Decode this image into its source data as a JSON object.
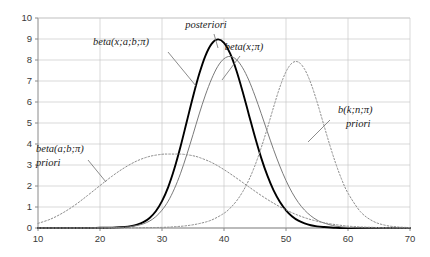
{
  "chart_data": {
    "type": "line",
    "title": "",
    "xlabel": "",
    "ylabel": "",
    "xlim": [
      10,
      70
    ],
    "ylim": [
      0,
      10
    ],
    "xticks": [
      10,
      20,
      30,
      40,
      50,
      60,
      70
    ],
    "yticks": [
      0,
      1,
      2,
      3,
      4,
      5,
      6,
      7,
      8,
      9,
      10
    ],
    "grid": true,
    "legend_position": "inline-annotations",
    "series": [
      {
        "name": "posteriori",
        "label": "posteriori",
        "style": "solid-bold",
        "color": "#000000",
        "width": 1.9,
        "peak_x": 39,
        "peak_y": 9.0,
        "x": [
          10,
          12,
          14,
          16,
          18,
          20,
          22,
          24,
          25,
          26,
          27,
          28,
          29,
          30,
          31,
          32,
          33,
          34,
          35,
          36,
          37,
          38,
          39,
          40,
          41,
          42,
          43,
          44,
          45,
          46,
          47,
          48,
          49,
          50,
          51,
          52,
          53,
          54,
          55,
          56,
          58,
          60,
          62,
          64,
          66,
          68,
          70
        ],
        "y": [
          0.0,
          0.0,
          0.0,
          0.0,
          0.0,
          0.01,
          0.02,
          0.05,
          0.09,
          0.16,
          0.28,
          0.48,
          0.8,
          1.28,
          1.95,
          2.83,
          3.89,
          5.07,
          6.25,
          7.33,
          8.2,
          8.77,
          8.98,
          8.82,
          8.3,
          7.5,
          6.5,
          5.41,
          4.33,
          3.34,
          2.49,
          1.79,
          1.25,
          0.84,
          0.55,
          0.35,
          0.22,
          0.13,
          0.08,
          0.05,
          0.01,
          0.0,
          0.0,
          0.0,
          0.0,
          0.0,
          0.0
        ]
      },
      {
        "name": "beta-x-a-b-pi",
        "label": "beta(x;a;b;π)",
        "style": "solid-thin",
        "color": "#7a7a7a",
        "width": 1.0,
        "peak_x": 41,
        "peak_y": 8.2,
        "x": [
          10,
          12,
          14,
          16,
          18,
          20,
          22,
          24,
          25,
          26,
          27,
          28,
          29,
          30,
          31,
          32,
          33,
          34,
          35,
          36,
          37,
          38,
          39,
          40,
          41,
          42,
          43,
          44,
          45,
          46,
          47,
          48,
          49,
          50,
          51,
          52,
          53,
          54,
          55,
          56,
          58,
          60,
          62,
          64,
          66,
          68,
          70
        ],
        "y": [
          0.0,
          0.0,
          0.0,
          0.0,
          0.0,
          0.01,
          0.02,
          0.04,
          0.07,
          0.12,
          0.2,
          0.33,
          0.54,
          0.85,
          1.28,
          1.87,
          2.61,
          3.49,
          4.45,
          5.43,
          6.33,
          7.1,
          7.7,
          8.06,
          8.17,
          8.02,
          7.63,
          7.04,
          6.29,
          5.45,
          4.58,
          3.73,
          2.95,
          2.26,
          1.68,
          1.21,
          0.85,
          0.58,
          0.38,
          0.25,
          0.09,
          0.03,
          0.01,
          0.0,
          0.0,
          0.0,
          0.0
        ]
      },
      {
        "name": "beta-a-b-pi-priori",
        "label": "beta(a;b;π)",
        "sublabel": "priori",
        "style": "dashed",
        "color": "#8c8c8c",
        "width": 1.0,
        "peak_x": 33,
        "peak_y": 3.52,
        "x": [
          10,
          12,
          14,
          16,
          18,
          20,
          22,
          24,
          26,
          28,
          30,
          31,
          32,
          33,
          34,
          35,
          36,
          38,
          40,
          42,
          44,
          46,
          48,
          50,
          52,
          54,
          56,
          58,
          60,
          62,
          64,
          66,
          68,
          70
        ],
        "y": [
          0.22,
          0.42,
          0.72,
          1.1,
          1.55,
          2.02,
          2.48,
          2.88,
          3.2,
          3.41,
          3.51,
          3.52,
          3.52,
          3.52,
          3.49,
          3.44,
          3.36,
          3.12,
          2.78,
          2.38,
          1.96,
          1.55,
          1.18,
          0.86,
          0.6,
          0.4,
          0.26,
          0.16,
          0.09,
          0.05,
          0.03,
          0.01,
          0.01,
          0.0
        ]
      },
      {
        "name": "b-k-n-pi-priori",
        "label": "b(k;n;π)",
        "sublabel": "priori",
        "style": "dashed",
        "color": "#8c8c8c",
        "width": 1.0,
        "peak_x": 50,
        "peak_y": 7.9,
        "x": [
          10,
          14,
          18,
          22,
          26,
          30,
          32,
          34,
          36,
          38,
          40,
          41,
          42,
          43,
          44,
          45,
          46,
          47,
          48,
          49,
          50,
          51,
          52,
          53,
          54,
          55,
          56,
          57,
          58,
          59,
          60,
          62,
          64,
          66,
          68,
          70
        ],
        "y": [
          0.0,
          0.0,
          0.0,
          0.0,
          0.01,
          0.03,
          0.06,
          0.11,
          0.21,
          0.38,
          0.7,
          0.95,
          1.28,
          1.72,
          2.28,
          2.98,
          3.82,
          4.76,
          5.76,
          6.7,
          7.44,
          7.86,
          7.9,
          7.56,
          6.9,
          6.01,
          5.01,
          4.01,
          3.09,
          2.3,
          1.66,
          0.78,
          0.33,
          0.13,
          0.05,
          0.02
        ]
      }
    ],
    "annotations": [
      {
        "id": "posteriori-label",
        "text": "posteriori",
        "x_px": 206,
        "y_px": 28
      },
      {
        "id": "beta-x-a-b-pi-label",
        "text": "beta(x;a;b;π)",
        "x_px": 121,
        "y_px": 45
      },
      {
        "id": "beta-x-pi-label",
        "text": "beta(x;π)",
        "x_px": 244,
        "y_px": 50
      },
      {
        "id": "b-k-n-pi-label",
        "text": "b(k;n;π)",
        "x_px": 338,
        "y_px": 113
      },
      {
        "id": "b-k-n-pi-priori-label",
        "text": "priori",
        "x_px": 346,
        "y_px": 127
      },
      {
        "id": "beta-a-b-pi-label",
        "text": "beta(a;b;π)",
        "x_px": 36,
        "y_px": 152
      },
      {
        "id": "beta-a-b-pi-priori-label",
        "text": "priori",
        "x_px": 36,
        "y_px": 166
      }
    ]
  },
  "axis": {
    "y_labels": [
      "10",
      "9",
      "8",
      "7",
      "6",
      "5",
      "4",
      "3",
      "2",
      "1",
      "0"
    ],
    "x_labels": [
      "10",
      "20",
      "30",
      "40",
      "50",
      "60",
      "70"
    ]
  },
  "colors": {
    "background": "#ffffff",
    "grid": "#c8c8c8",
    "axis": "#8a8a8a",
    "posteriori": "#000000",
    "beta_solid": "#7a7a7a",
    "dashed": "#8c8c8c",
    "leader": "#6f6f6f",
    "tick_text": "#3a3a3a"
  }
}
